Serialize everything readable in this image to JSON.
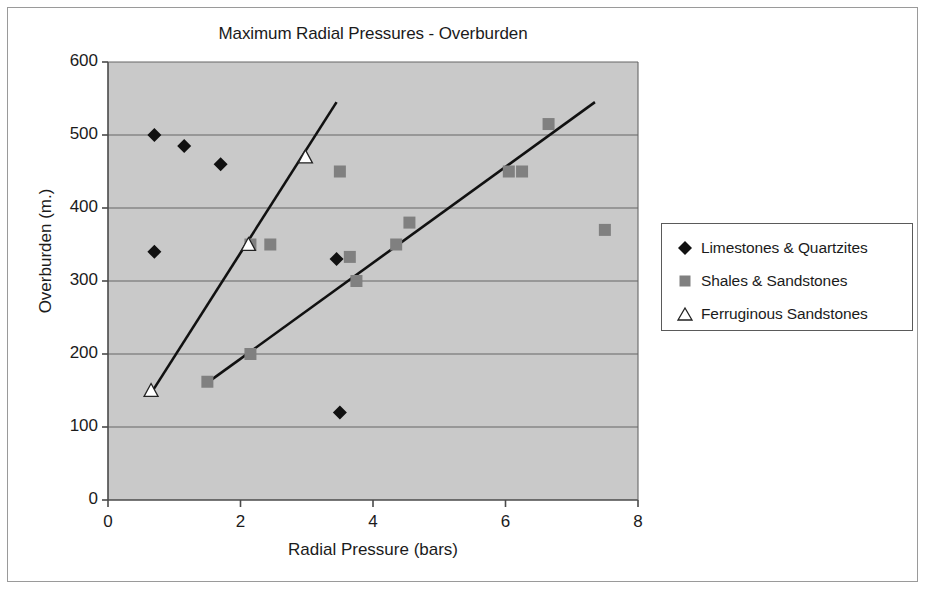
{
  "figure": {
    "title": "Maximum Radial Pressures - Overburden"
  },
  "legend": {
    "items": [
      {
        "label": "Limestones & Quartzites",
        "marker": "diamond",
        "color": "#111111"
      },
      {
        "label": "Shales & Sandstones",
        "marker": "square",
        "color": "#808080"
      },
      {
        "label": "Ferruginous  Sandstones",
        "marker": "triangle",
        "color": "#ffffff"
      }
    ]
  },
  "colors": {
    "plot_background": "#c9c9c9",
    "gridline": "#666666",
    "axis": "#4a4a4a",
    "trendline": "#111111",
    "diamond": "#111111",
    "square": "#808080",
    "triangle_fill": "#ffffff",
    "triangle_stroke": "#222222",
    "frame": "#9a9a9a",
    "text": "#1b1b1b"
  },
  "chart_data": {
    "type": "scatter",
    "title": "Maximum Radial Pressures - Overburden",
    "xlabel": "Radial Pressure (bars)",
    "ylabel": "Overburden (m.)",
    "xlim": [
      0,
      8
    ],
    "ylim": [
      0,
      600
    ],
    "xticks": [
      0,
      2,
      4,
      6,
      8
    ],
    "yticks": [
      0,
      100,
      200,
      300,
      400,
      500,
      600
    ],
    "grid": "horizontal",
    "legend_position": "right",
    "series": [
      {
        "name": "Limestones & Quartzites",
        "marker": "diamond",
        "color": "#111111",
        "points": [
          [
            0.7,
            500
          ],
          [
            1.15,
            485
          ],
          [
            1.7,
            460
          ],
          [
            0.7,
            340
          ],
          [
            3.45,
            330
          ],
          [
            3.5,
            120
          ]
        ]
      },
      {
        "name": "Shales & Sandstones",
        "marker": "square",
        "color": "#808080",
        "points": [
          [
            6.65,
            515
          ],
          [
            6.05,
            450
          ],
          [
            6.25,
            450
          ],
          [
            3.5,
            450
          ],
          [
            4.55,
            380
          ],
          [
            7.5,
            370
          ],
          [
            2.15,
            350
          ],
          [
            2.45,
            350
          ],
          [
            4.35,
            350
          ],
          [
            3.65,
            333
          ],
          [
            3.75,
            300
          ],
          [
            2.15,
            200
          ],
          [
            1.5,
            162
          ]
        ]
      },
      {
        "name": "Ferruginous  Sandstones",
        "marker": "triangle",
        "color": "#ffffff",
        "points": [
          [
            2.98,
            470
          ],
          [
            2.12,
            350
          ],
          [
            0.65,
            150
          ]
        ]
      }
    ],
    "trendlines": [
      {
        "name": "steep-trendline",
        "x0": 0.62,
        "y0": 142,
        "x1": 3.45,
        "y1": 545
      },
      {
        "name": "shallow-trendline",
        "x0": 1.46,
        "y0": 158,
        "x1": 7.35,
        "y1": 545
      }
    ]
  }
}
